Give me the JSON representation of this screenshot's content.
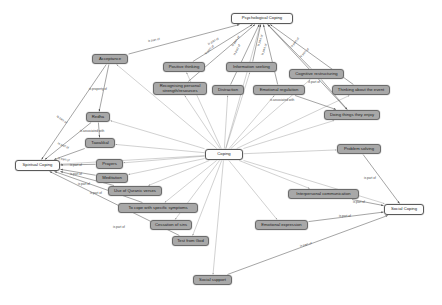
{
  "diagram": {
    "type": "directed-concept-map",
    "colors": {
      "node_fill": "#a8a8a8",
      "root_fill": "#fdfdfd",
      "node_border": "#6b6b6b",
      "edge_stroke": "#8c8c8c",
      "edge_stroke_dark": "#5a5a5a",
      "label_text": "#4a4a4a",
      "background": "#ffffff"
    },
    "relations": [
      "is part of",
      "is property of",
      "is associated with"
    ]
  },
  "nodes": [
    {
      "id": "coping",
      "label": "Coping",
      "x": 205,
      "y": 149,
      "w": 38,
      "h": 11,
      "root": true
    },
    {
      "id": "psych",
      "label": "Psychological Coping",
      "x": 231,
      "y": 13,
      "w": 62,
      "h": 11,
      "root": true
    },
    {
      "id": "spiritual",
      "label": "Spiritual Coping",
      "x": 15,
      "y": 160,
      "w": 45,
      "h": 11,
      "root": true
    },
    {
      "id": "social",
      "label": "Social Coping",
      "x": 384,
      "y": 204,
      "w": 40,
      "h": 11,
      "root": true
    },
    {
      "id": "acceptance",
      "label": "Acceptance",
      "x": 92,
      "y": 54,
      "w": 36,
      "h": 10,
      "root": false
    },
    {
      "id": "positive",
      "label": "Positive thinking",
      "x": 163,
      "y": 62,
      "w": 42,
      "h": 10,
      "root": false
    },
    {
      "id": "infoseek",
      "label": "Information seeking",
      "x": 226,
      "y": 62,
      "w": 51,
      "h": 10,
      "root": false
    },
    {
      "id": "cogrestruct",
      "label": "Cognitive restructuring",
      "x": 289,
      "y": 69,
      "w": 55,
      "h": 10,
      "root": false
    },
    {
      "id": "recognising",
      "label": "Recognising personal\nstrength/resources",
      "x": 153,
      "y": 82,
      "w": 54,
      "h": 13,
      "root": false
    },
    {
      "id": "distraction",
      "label": "Distraction",
      "x": 212,
      "y": 85,
      "w": 32,
      "h": 10,
      "root": false
    },
    {
      "id": "emoreg",
      "label": "Emotional regulation",
      "x": 253,
      "y": 85,
      "w": 52,
      "h": 10,
      "root": false
    },
    {
      "id": "thinkevent",
      "label": "Thinking about the event",
      "x": 332,
      "y": 85,
      "w": 58,
      "h": 10,
      "root": false
    },
    {
      "id": "enjoy",
      "label": "Doing things they enjoy",
      "x": 324,
      "y": 110,
      "w": 56,
      "h": 10,
      "root": false
    },
    {
      "id": "redha",
      "label": "Redha",
      "x": 86,
      "y": 112,
      "w": 24,
      "h": 10,
      "root": false
    },
    {
      "id": "tawakkul",
      "label": "Tawakkal",
      "x": 85,
      "y": 138,
      "w": 30,
      "h": 10,
      "root": false
    },
    {
      "id": "prayers",
      "label": "Prayers",
      "x": 96,
      "y": 159,
      "w": 27,
      "h": 10,
      "root": false
    },
    {
      "id": "problemsolv",
      "label": "Problem solving",
      "x": 337,
      "y": 144,
      "w": 44,
      "h": 10,
      "root": false
    },
    {
      "id": "meditation",
      "label": "Meditation",
      "x": 96,
      "y": 173,
      "w": 32,
      "h": 10,
      "root": false
    },
    {
      "id": "quranic",
      "label": "Use of Quranic verses",
      "x": 108,
      "y": 186,
      "w": 54,
      "h": 10,
      "root": false
    },
    {
      "id": "interpersonal",
      "label": "Interpersonal communication",
      "x": 288,
      "y": 189,
      "w": 71,
      "h": 10,
      "root": false
    },
    {
      "id": "symptoms",
      "label": "To cope with specific symptoms",
      "x": 118,
      "y": 203,
      "w": 80,
      "h": 10,
      "root": false
    },
    {
      "id": "cessation",
      "label": "Cessation of sins",
      "x": 150,
      "y": 220,
      "w": 42,
      "h": 10,
      "root": false
    },
    {
      "id": "emoexpr",
      "label": "Emotional expression",
      "x": 255,
      "y": 220,
      "w": 53,
      "h": 10,
      "root": false
    },
    {
      "id": "testgod",
      "label": "Test from God",
      "x": 172,
      "y": 236,
      "w": 37,
      "h": 10,
      "root": false
    },
    {
      "id": "socsupport",
      "label": "Social support",
      "x": 193,
      "y": 275,
      "w": 39,
      "h": 10,
      "root": false
    }
  ],
  "edges": [
    {
      "from": "acceptance",
      "to": "psych",
      "label": "is part of",
      "lx": 148,
      "ly": 39,
      "rot": -10
    },
    {
      "from": "positive",
      "to": "psych",
      "label": "is part of",
      "lx": 208,
      "ly": 42,
      "rot": -28
    },
    {
      "from": "recognising",
      "to": "psych",
      "label": "is part of",
      "lx": 205,
      "ly": 52,
      "rot": -45
    },
    {
      "from": "infoseek",
      "to": "psych",
      "label": "is part of",
      "lx": 232,
      "ly": 44,
      "rot": -55
    },
    {
      "from": "distraction",
      "to": "psych",
      "label": "is part of",
      "lx": 234,
      "ly": 53,
      "rot": -62
    },
    {
      "from": "emoreg",
      "to": "psych",
      "label": "is part of",
      "lx": 258,
      "ly": 44,
      "rot": -70
    },
    {
      "from": "cogrestruct",
      "to": "psych",
      "label": "is part of",
      "lx": 262,
      "ly": 53,
      "rot": -70
    },
    {
      "from": "thinkevent",
      "to": "psych",
      "label": "is part of",
      "lx": 291,
      "ly": 45,
      "rot": -50
    },
    {
      "from": "enjoy",
      "to": "psych",
      "label": "is part of",
      "lx": 300,
      "ly": 55,
      "rot": -45
    },
    {
      "from": "acceptance",
      "to": "redha",
      "label": "is property of",
      "lx": 89,
      "ly": 87,
      "rot": 0
    },
    {
      "from": "acceptance",
      "to": "spiritual",
      "label": "is part of",
      "lx": 57,
      "ly": 114,
      "rot": 35
    },
    {
      "from": "redha",
      "to": "tawakkul",
      "label": "is associated with",
      "lx": 80,
      "ly": 129,
      "rot": 0
    },
    {
      "from": "redha",
      "to": "spiritual",
      "label": "is part of",
      "lx": 58,
      "ly": 141,
      "rot": 25
    },
    {
      "from": "tawakkul",
      "to": "spiritual",
      "label": "is part of",
      "lx": 58,
      "ly": 156,
      "rot": 12
    },
    {
      "from": "prayers",
      "to": "spiritual",
      "label": "is part of",
      "lx": 70,
      "ly": 163,
      "rot": 0
    },
    {
      "from": "meditation",
      "to": "spiritual",
      "label": "is part of",
      "lx": 70,
      "ly": 172,
      "rot": 0
    },
    {
      "from": "quranic",
      "to": "spiritual",
      "label": "is part of",
      "lx": 78,
      "ly": 182,
      "rot": 0
    },
    {
      "from": "symptoms",
      "to": "spiritual",
      "label": "is part of",
      "lx": 90,
      "ly": 191,
      "rot": 0
    },
    {
      "from": "testgod",
      "to": "spiritual",
      "label": "is part of",
      "lx": 113,
      "ly": 225,
      "rot": 0
    },
    {
      "from": "cogrestruct",
      "to": "enjoy",
      "label": "is part of",
      "lx": 308,
      "ly": 80,
      "rot": 0
    },
    {
      "from": "emoreg",
      "to": "enjoy",
      "label": "is associated with",
      "lx": 270,
      "ly": 98,
      "rot": 0
    },
    {
      "from": "problemsolv",
      "to": "social",
      "label": "is part of",
      "lx": 364,
      "ly": 176,
      "rot": 0
    },
    {
      "from": "interpersonal",
      "to": "social",
      "label": "is part of",
      "lx": 353,
      "ly": 200,
      "rot": 0
    },
    {
      "from": "emoexpr",
      "to": "social",
      "label": "is part of",
      "lx": 339,
      "ly": 214,
      "rot": 0
    },
    {
      "from": "socsupport",
      "to": "social",
      "label": "is part of",
      "lx": 300,
      "ly": 244,
      "rot": -14
    }
  ],
  "hub_edges": [
    "coping-psych",
    "coping-spiritual",
    "coping-social",
    "coping-acceptance",
    "coping-positive",
    "coping-infoseek",
    "coping-cogrestruct",
    "coping-recognising",
    "coping-distraction",
    "coping-emoreg",
    "coping-thinkevent",
    "coping-enjoy",
    "coping-redha",
    "coping-tawakkul",
    "coping-prayers",
    "coping-meditation",
    "coping-quranic",
    "coping-symptoms",
    "coping-cessation",
    "coping-testgod",
    "coping-problemsolv",
    "coping-interpersonal",
    "coping-emoexpr",
    "coping-socsupport"
  ]
}
